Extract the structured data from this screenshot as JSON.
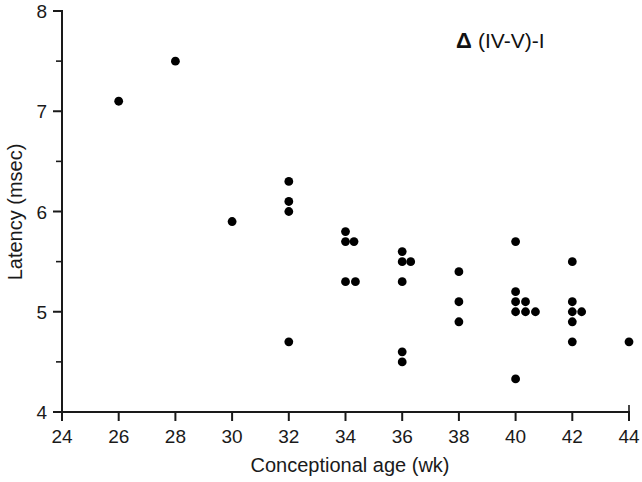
{
  "chart_data": {
    "type": "scatter",
    "title": "",
    "annotation": {
      "symbol": "Δ",
      "text": "(IV-V)-I"
    },
    "xlabel": "Conceptional age (wk)",
    "ylabel": "Latency (msec)",
    "xlim": [
      24,
      44
    ],
    "ylim": [
      4,
      8
    ],
    "xticks": [
      24,
      26,
      28,
      30,
      32,
      34,
      36,
      38,
      40,
      42,
      44
    ],
    "xtick_labels": [
      "24",
      "26",
      "28",
      "30",
      "32",
      "34",
      "36",
      "38",
      "40",
      "42",
      "44"
    ],
    "yticks": [
      4,
      5,
      6,
      7,
      8
    ],
    "ytick_labels": [
      "4",
      "5",
      "6",
      "7",
      "8"
    ],
    "yticks_minor": [
      4.5,
      5.5,
      6.5,
      7.5
    ],
    "grid": false,
    "legend": null,
    "marker": "filled-circle",
    "marker_color": "#000000",
    "marker_size_px": 4.4,
    "jitter_note": "Overlapping observations at the same age are offset slightly to the right",
    "points": [
      {
        "x": 26,
        "y": 7.1
      },
      {
        "x": 28,
        "y": 7.5
      },
      {
        "x": 30,
        "y": 5.9
      },
      {
        "x": 32,
        "y": 6.3
      },
      {
        "x": 32,
        "y": 6.1
      },
      {
        "x": 32,
        "y": 6.0
      },
      {
        "x": 32,
        "y": 4.7
      },
      {
        "x": 34,
        "y": 5.8
      },
      {
        "x": 34,
        "y": 5.7
      },
      {
        "x": 34.3,
        "y": 5.7
      },
      {
        "x": 34,
        "y": 5.3
      },
      {
        "x": 34.35,
        "y": 5.3
      },
      {
        "x": 36,
        "y": 5.6
      },
      {
        "x": 36,
        "y": 5.5
      },
      {
        "x": 36.3,
        "y": 5.5
      },
      {
        "x": 36,
        "y": 5.3
      },
      {
        "x": 36,
        "y": 4.6
      },
      {
        "x": 36,
        "y": 4.5
      },
      {
        "x": 38,
        "y": 5.4
      },
      {
        "x": 38,
        "y": 5.1
      },
      {
        "x": 38,
        "y": 4.9
      },
      {
        "x": 40,
        "y": 5.7
      },
      {
        "x": 40,
        "y": 5.2
      },
      {
        "x": 40,
        "y": 5.1
      },
      {
        "x": 40.35,
        "y": 5.1
      },
      {
        "x": 40,
        "y": 5.0
      },
      {
        "x": 40.35,
        "y": 5.0
      },
      {
        "x": 40.7,
        "y": 5.0
      },
      {
        "x": 40,
        "y": 4.33
      },
      {
        "x": 42,
        "y": 5.5
      },
      {
        "x": 42,
        "y": 5.1
      },
      {
        "x": 42,
        "y": 5.0
      },
      {
        "x": 42.33,
        "y": 5.0
      },
      {
        "x": 42,
        "y": 4.9
      },
      {
        "x": 42,
        "y": 4.7
      },
      {
        "x": 44,
        "y": 4.7
      }
    ],
    "n_points": 36
  }
}
